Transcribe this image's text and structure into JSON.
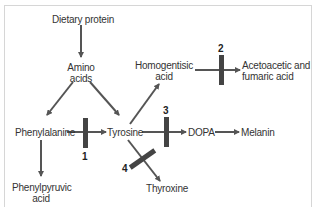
{
  "diagram": {
    "type": "metabolic-pathway",
    "colors": {
      "line": "#555555",
      "block": "#444444",
      "text": "#333333",
      "border": "#d6d6d6"
    },
    "nodes": {
      "dietary_protein": "Dietary protein",
      "amino_acids_1": "Amino",
      "amino_acids_2": "acids",
      "phenylalanine": "Phenylalanine",
      "tyrosine": "Tyrosine",
      "homogentisic_1": "Homogentisic",
      "homogentisic_2": "acid",
      "acetoacetic_1": "Acetoacetic and",
      "acetoacetic_2": "fumaric acid",
      "dopa": "DOPA",
      "melanin": "Melanin",
      "thyroxine": "Thyroxine",
      "phenylpyruvic_1": "Phenylpyruvic",
      "phenylpyruvic_2": "acid"
    },
    "blocks": {
      "b1": "1",
      "b2": "2",
      "b3": "3",
      "b4": "4"
    },
    "edges": [
      {
        "from": "Dietary protein",
        "to": "Amino acids"
      },
      {
        "from": "Amino acids",
        "to": "Phenylalanine"
      },
      {
        "from": "Amino acids",
        "to": "Tyrosine"
      },
      {
        "from": "Phenylalanine",
        "to": "Tyrosine",
        "blocked_by": "1"
      },
      {
        "from": "Phenylalanine",
        "to": "Phenylpyruvic acid"
      },
      {
        "from": "Tyrosine",
        "to": "Homogentisic acid"
      },
      {
        "from": "Homogentisic acid",
        "to": "Acetoacetic and fumaric acid",
        "blocked_by": "2"
      },
      {
        "from": "Tyrosine",
        "to": "DOPA",
        "blocked_by": "3"
      },
      {
        "from": "DOPA",
        "to": "Melanin"
      },
      {
        "from": "Tyrosine",
        "to": "Thyroxine",
        "blocked_by": "4"
      }
    ]
  }
}
